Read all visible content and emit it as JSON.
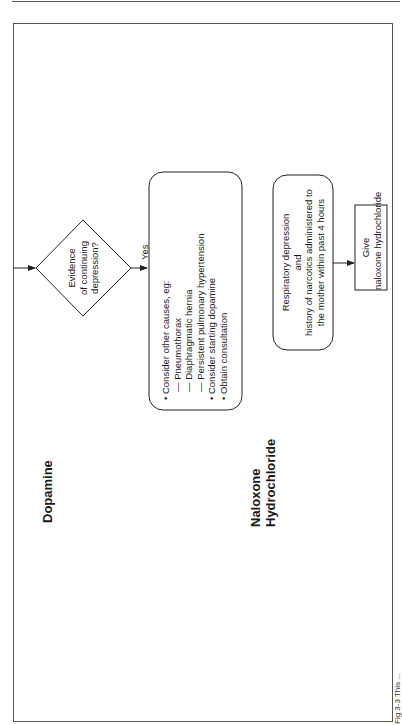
{
  "figure": {
    "orientation": "rotated-90-ccw",
    "sections": [
      {
        "id": "dopamine",
        "label": "Dopamine"
      },
      {
        "id": "naloxone",
        "label_lines": [
          "Naloxone",
          "Hydrochloride"
        ]
      }
    ],
    "dopamine_flow": {
      "decision": {
        "lines": [
          "Evidence",
          "of continuing",
          "depression?"
        ]
      },
      "yes_label": "Yes",
      "action_box": {
        "items": [
          "• Consider other causes, eg:",
          "— Pneumothorax",
          "— Diaphragmatic hernia",
          "— Persistent pulmonary hypertension",
          "• Consider starting dopamine",
          "• Obtain consultation"
        ]
      }
    },
    "naloxone_flow": {
      "condition_box": {
        "lines": [
          "Respiratory depression",
          "and",
          "history of narcotics administered to",
          "the mother within past 4 hours"
        ]
      },
      "action_box": {
        "lines": [
          "Give",
          "naloxone hydrochloride"
        ]
      }
    },
    "caption": "Fig 3-3 This ..."
  }
}
